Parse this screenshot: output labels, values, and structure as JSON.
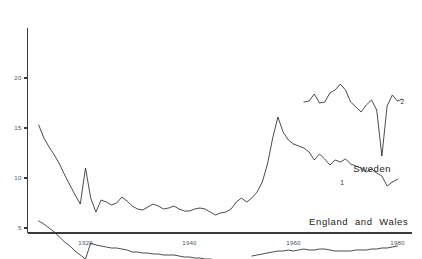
{
  "chart_data": {
    "type": "line",
    "title": "",
    "subtitle": "",
    "xlabel": "",
    "ylabel": "",
    "xlim": [
      1909,
      1982
    ],
    "ylim": [
      0,
      20
    ],
    "grid": false,
    "legend": "inline-annotations",
    "y_ticks": [
      5,
      10,
      15,
      20
    ],
    "y_tick_labels": [
      "5",
      "10",
      "15",
      "20"
    ],
    "x_ticks": [
      1920,
      1940,
      1960,
      1980
    ],
    "x_tick_labels": [
      "1920",
      "1940",
      "1960",
      "1980"
    ],
    "annotations": [
      {
        "text": "Sweden",
        "x": 1971.5,
        "y": 10.9
      },
      {
        "text": "England  and  Wales",
        "x": 1963.0,
        "y": 5.6
      },
      {
        "text": "1",
        "x": 1969.0,
        "y": 9.5
      },
      {
        "text": "2",
        "x": 1980.6,
        "y": 17.6
      }
    ],
    "series": [
      {
        "name": "England and Wales",
        "label": "England and Wales",
        "segment": "upper-early",
        "x": [
          1911,
          1912,
          1913,
          1914,
          1915,
          1916,
          1917,
          1918,
          1919,
          1920,
          1921,
          1922,
          1923,
          1924,
          1925,
          1926,
          1927,
          1928,
          1929,
          1930,
          1931,
          1932,
          1933,
          1934,
          1935,
          1936,
          1937,
          1938,
          1939,
          1940,
          1941,
          1942,
          1943,
          1944,
          1945,
          1946,
          1947,
          1948,
          1949,
          1950,
          1951,
          1952,
          1953,
          1954,
          1955,
          1956,
          1957,
          1958,
          1959,
          1960
        ],
        "y": [
          15.3,
          14.0,
          13.1,
          12.3,
          11.4,
          10.3,
          9.3,
          8.3,
          7.4,
          11.0,
          8.0,
          6.6,
          7.8,
          7.6,
          7.3,
          7.5,
          8.1,
          7.7,
          7.2,
          6.9,
          6.8,
          7.1,
          7.4,
          7.2,
          6.9,
          7.0,
          7.2,
          6.9,
          6.7,
          6.7,
          6.9,
          7.0,
          6.9,
          6.6,
          6.3,
          6.5,
          6.6,
          6.9,
          7.6,
          8.0,
          7.6,
          8.0,
          8.6,
          9.6,
          11.4,
          14.0,
          16.1,
          14.6,
          13.8,
          13.4
        ]
      },
      {
        "name": "Sweden 1",
        "label": "1",
        "segment": "sweden-lower",
        "x": [
          1960,
          1961,
          1962,
          1963,
          1964,
          1965,
          1966,
          1967,
          1968,
          1969,
          1970,
          1971,
          1972,
          1973,
          1974,
          1975,
          1976,
          1977,
          1978,
          1979
        ],
        "y": [
          13.4,
          13.2,
          13.0,
          12.6,
          11.8,
          12.4,
          11.9,
          11.3,
          11.8,
          11.6,
          11.9,
          11.4,
          11.2,
          11.0,
          10.6,
          10.9,
          10.5,
          10.2,
          9.2,
          9.6
        ]
      },
      {
        "name": "Sweden 2",
        "label": "2",
        "segment": "sweden-upper",
        "x": [
          1962,
          1963,
          1964,
          1965,
          1966,
          1967,
          1968,
          1969,
          1970,
          1971,
          1972,
          1973,
          1974,
          1975,
          1976,
          1977,
          1978,
          1979,
          1980
        ],
        "y": [
          17.6,
          17.7,
          18.4,
          17.5,
          17.6,
          18.5,
          18.8,
          19.4,
          18.8,
          17.6,
          17.1,
          16.6,
          17.3,
          17.8,
          16.8,
          12.2,
          17.2,
          18.3,
          17.7
        ]
      },
      {
        "name": "England and Wales lower early",
        "label": "England and Wales",
        "segment": "lower-early",
        "x": [
          1911,
          1912,
          1913,
          1914,
          1915,
          1916,
          1917,
          1918,
          1919,
          1920,
          1921,
          1922,
          1923,
          1924,
          1925,
          1926,
          1927,
          1928,
          1929,
          1930,
          1931,
          1932,
          1933,
          1934,
          1935,
          1936,
          1937,
          1938,
          1939,
          1940,
          1941,
          1942,
          1943,
          1944,
          1945,
          1946,
          1947
        ],
        "y": [
          5.7,
          5.4,
          5.0,
          4.6,
          4.1,
          3.6,
          3.2,
          2.7,
          2.3,
          1.9,
          3.5,
          3.3,
          3.2,
          3.1,
          3.0,
          3.0,
          2.9,
          2.8,
          2.6,
          2.6,
          2.5,
          2.5,
          2.4,
          2.4,
          2.3,
          2.3,
          2.3,
          2.2,
          2.1,
          2.1,
          2.0,
          2.0,
          1.9,
          1.9,
          1.8,
          1.8,
          1.8
        ]
      },
      {
        "name": "England and Wales lower late",
        "label": "England and Wales",
        "segment": "lower-late",
        "x": [
          1952,
          1953,
          1954,
          1955,
          1956,
          1957,
          1958,
          1959,
          1960,
          1961,
          1962,
          1963,
          1964,
          1965,
          1966,
          1967,
          1968,
          1969,
          1970,
          1971,
          1972,
          1973,
          1974,
          1975,
          1976,
          1977,
          1978,
          1979,
          1980
        ],
        "y": [
          2.2,
          2.3,
          2.4,
          2.5,
          2.6,
          2.7,
          2.7,
          2.8,
          2.7,
          2.8,
          2.9,
          2.8,
          2.8,
          2.9,
          2.9,
          2.8,
          2.7,
          2.7,
          2.7,
          2.7,
          2.8,
          2.8,
          2.8,
          2.9,
          2.9,
          3.0,
          3.0,
          3.1,
          3.2
        ]
      }
    ],
    "colors": {
      "line": "#2b2b2b",
      "axis": "#3a3a3a",
      "tick_label": "#55585c",
      "annotation": "#1c1c1c",
      "background": "#ffffff"
    }
  }
}
